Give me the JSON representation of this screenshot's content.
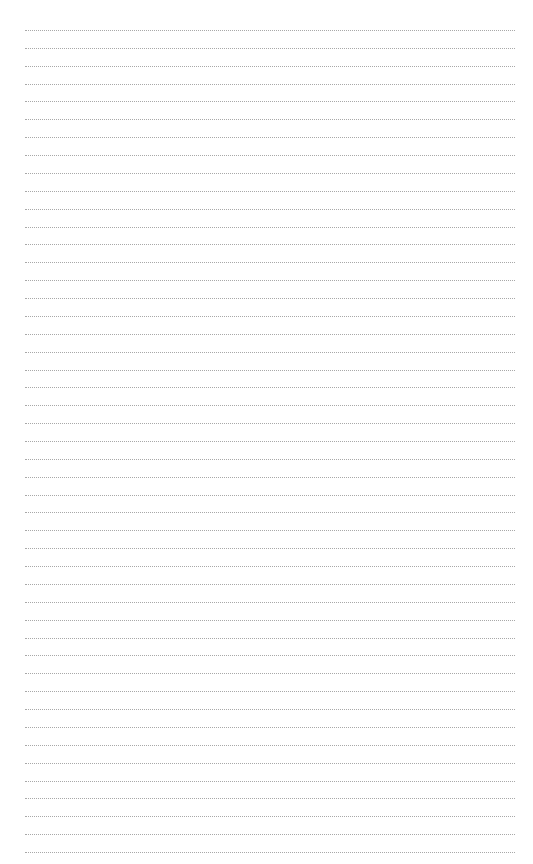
{
  "page": {
    "type": "lined-paper",
    "line_count": 47,
    "first_line_y": 30,
    "line_spacing": 17.87,
    "line_left": 25,
    "line_width": 490,
    "line_color": "#a8a8a8",
    "background": "#ffffff"
  }
}
